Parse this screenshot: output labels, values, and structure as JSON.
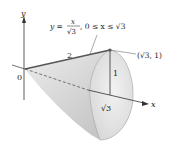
{
  "figure": {
    "type": "cone-of-revolution",
    "equation": {
      "lhs": "y =",
      "numerator": "x",
      "denominator": "√3",
      "domain": ", 0 ≤ x ≤ √3"
    },
    "labels": {
      "y_axis": "y",
      "x_axis": "x",
      "origin": "0",
      "slant_length": "2",
      "height": "1",
      "base_distance": "√3",
      "point": "(√3, 1)"
    },
    "colors": {
      "cone_fill": "#d4d4d4",
      "cone_inner": "#e6e6e6",
      "line": "#333333",
      "slant_line": "#555555"
    }
  }
}
